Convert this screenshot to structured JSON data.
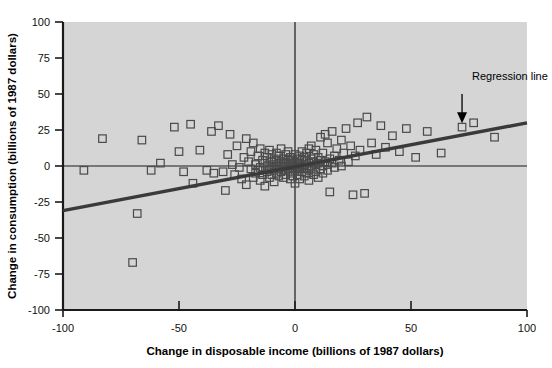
{
  "chart_data": {
    "type": "scatter",
    "title": "",
    "xlabel": "Change in disposable income (billions of 1987 dollars)",
    "ylabel": "Change in consumption (billions of 1987 dollars)",
    "xlim": [
      -100,
      100
    ],
    "ylim": [
      -100,
      100
    ],
    "xticks": [
      -100,
      -50,
      0,
      50,
      100
    ],
    "yticks": [
      -100,
      -75,
      -50,
      -25,
      0,
      25,
      50,
      75,
      100
    ],
    "xtick_labels": [
      "-100",
      "-50",
      "0",
      "50",
      "100"
    ],
    "ytick_labels": [
      "-100",
      "-75",
      "-50",
      "-25",
      "0",
      "25",
      "50",
      "75",
      "100"
    ],
    "grid": false,
    "legend": false,
    "marker_style": "open-square",
    "background_color": "#d5d5d5",
    "annotations": [
      {
        "text": "Regression line",
        "x": 72,
        "y": 57,
        "arrow_from_x": 72,
        "arrow_from_y": 48,
        "arrow_to_x": 72,
        "arrow_to_y": 29
      }
    ],
    "series": [
      {
        "name": "Change in consumption vs change in disposable income",
        "points": [
          [
            -91,
            -3
          ],
          [
            -83,
            19
          ],
          [
            -70,
            -67
          ],
          [
            -68,
            -33
          ],
          [
            -66,
            18
          ],
          [
            -52,
            27
          ],
          [
            -50,
            10
          ],
          [
            -45,
            29
          ],
          [
            -41,
            11
          ],
          [
            -38,
            -3
          ],
          [
            -35,
            -5
          ],
          [
            -33,
            28
          ],
          [
            -31,
            -4
          ],
          [
            -28,
            22
          ],
          [
            -27,
            1
          ],
          [
            -26,
            -6
          ],
          [
            -25,
            14
          ],
          [
            -24,
            -1
          ],
          [
            -23,
            -9
          ],
          [
            -22,
            6
          ],
          [
            -21,
            19
          ],
          [
            -21,
            -13
          ],
          [
            -20,
            3
          ],
          [
            -19,
            -2
          ],
          [
            -19,
            10
          ],
          [
            -18,
            -8
          ],
          [
            -18,
            16
          ],
          [
            -17,
            1
          ],
          [
            -17,
            -5
          ],
          [
            -16,
            7
          ],
          [
            -16,
            -3
          ],
          [
            -15,
            12
          ],
          [
            -15,
            -1
          ],
          [
            -15,
            -10
          ],
          [
            -14,
            4
          ],
          [
            -14,
            -6
          ],
          [
            -13,
            2
          ],
          [
            -13,
            9
          ],
          [
            -13,
            -14
          ],
          [
            -12,
            0
          ],
          [
            -12,
            -4
          ],
          [
            -12,
            6
          ],
          [
            -11,
            -2
          ],
          [
            -11,
            11
          ],
          [
            -11,
            -8
          ],
          [
            -10,
            3
          ],
          [
            -10,
            -1
          ],
          [
            -10,
            -6
          ],
          [
            -10,
            8
          ],
          [
            -9,
            1
          ],
          [
            -9,
            -3
          ],
          [
            -9,
            5
          ],
          [
            -9,
            -11
          ],
          [
            -8,
            0
          ],
          [
            -8,
            4
          ],
          [
            -8,
            -5
          ],
          [
            -8,
            9
          ],
          [
            -7,
            2
          ],
          [
            -7,
            -2
          ],
          [
            -7,
            -7
          ],
          [
            -7,
            7
          ],
          [
            -6,
            0
          ],
          [
            -6,
            3
          ],
          [
            -6,
            -4
          ],
          [
            -6,
            12
          ],
          [
            -5,
            1
          ],
          [
            -5,
            -1
          ],
          [
            -5,
            5
          ],
          [
            -5,
            -8
          ],
          [
            -4,
            2
          ],
          [
            -4,
            -3
          ],
          [
            -4,
            8
          ],
          [
            -4,
            -6
          ],
          [
            -3,
            0
          ],
          [
            -3,
            4
          ],
          [
            -3,
            -2
          ],
          [
            -3,
            10
          ],
          [
            -2,
            1
          ],
          [
            -2,
            -5
          ],
          [
            -2,
            6
          ],
          [
            -2,
            -9
          ],
          [
            -1,
            2
          ],
          [
            -1,
            -1
          ],
          [
            -1,
            4
          ],
          [
            -1,
            -7
          ],
          [
            0,
            0
          ],
          [
            0,
            3
          ],
          [
            0,
            -3
          ],
          [
            0,
            8
          ],
          [
            0,
            -12
          ],
          [
            1,
            1
          ],
          [
            1,
            -2
          ],
          [
            1,
            5
          ],
          [
            1,
            -6
          ],
          [
            2,
            2
          ],
          [
            2,
            -1
          ],
          [
            2,
            7
          ],
          [
            2,
            -9
          ],
          [
            3,
            0
          ],
          [
            3,
            4
          ],
          [
            3,
            -4
          ],
          [
            3,
            10
          ],
          [
            4,
            1
          ],
          [
            4,
            -2
          ],
          [
            4,
            6
          ],
          [
            4,
            -7
          ],
          [
            5,
            3
          ],
          [
            5,
            -1
          ],
          [
            5,
            9
          ],
          [
            5,
            -5
          ],
          [
            6,
            2
          ],
          [
            6,
            -3
          ],
          [
            6,
            12
          ],
          [
            6,
            -10
          ],
          [
            7,
            0
          ],
          [
            7,
            5
          ],
          [
            7,
            -2
          ],
          [
            7,
            14
          ],
          [
            8,
            3
          ],
          [
            8,
            -6
          ],
          [
            8,
            8
          ],
          [
            9,
            1
          ],
          [
            9,
            -4
          ],
          [
            9,
            11
          ],
          [
            10,
            2
          ],
          [
            10,
            -8
          ],
          [
            10,
            6
          ],
          [
            11,
            4
          ],
          [
            11,
            -2
          ],
          [
            11,
            20
          ],
          [
            12,
            0
          ],
          [
            12,
            9
          ],
          [
            12,
            -5
          ],
          [
            13,
            3
          ],
          [
            13,
            22
          ],
          [
            14,
            1
          ],
          [
            14,
            -3
          ],
          [
            14,
            16
          ],
          [
            15,
            5
          ],
          [
            15,
            -18
          ],
          [
            16,
            2
          ],
          [
            16,
            24
          ],
          [
            17,
            7
          ],
          [
            17,
            -1
          ],
          [
            18,
            12
          ],
          [
            19,
            4
          ],
          [
            20,
            18
          ],
          [
            20,
            0
          ],
          [
            21,
            9
          ],
          [
            22,
            26
          ],
          [
            23,
            3
          ],
          [
            24,
            14
          ],
          [
            25,
            -20
          ],
          [
            26,
            7
          ],
          [
            27,
            30
          ],
          [
            28,
            11
          ],
          [
            30,
            -19
          ],
          [
            31,
            34
          ],
          [
            33,
            16
          ],
          [
            35,
            8
          ],
          [
            37,
            28
          ],
          [
            39,
            13
          ],
          [
            42,
            21
          ],
          [
            45,
            10
          ],
          [
            48,
            26
          ],
          [
            52,
            6
          ],
          [
            57,
            24
          ],
          [
            63,
            9
          ],
          [
            72,
            27
          ],
          [
            77,
            30
          ],
          [
            86,
            20
          ],
          [
            -58,
            2
          ],
          [
            -48,
            -4
          ],
          [
            -44,
            -12
          ],
          [
            -36,
            24
          ],
          [
            -30,
            -17
          ],
          [
            -29,
            8
          ],
          [
            -62,
            -3
          ]
        ]
      }
    ],
    "regression_line": {
      "x1": -100,
      "y1": -31,
      "x2": 100,
      "y2": 30,
      "color": "#3a3a3a"
    }
  }
}
